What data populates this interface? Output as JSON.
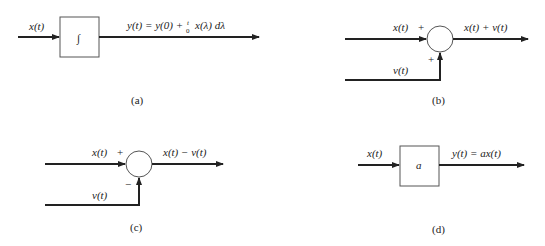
{
  "diagrams": {
    "a": {
      "caption": "(a)",
      "input_label": "x(t)",
      "block_symbol": "∫",
      "output_label": "y(t) = y(0) + ",
      "integral_upper": "t",
      "integral_lower": "0",
      "integrand": "x(λ) dλ",
      "block_type": "integrator"
    },
    "b": {
      "caption": "(b)",
      "input_top_label": "x(t)",
      "input_top_sign": "+",
      "input_bottom_label": "v(t)",
      "input_bottom_sign": "+",
      "output_label": "x(t) + v(t)",
      "block_type": "summer"
    },
    "c": {
      "caption": "(c)",
      "input_top_label": "x(t)",
      "input_top_sign": "+",
      "input_bottom_label": "v(t)",
      "input_bottom_sign": "−",
      "output_label": "x(t) − v(t)",
      "block_type": "subtractor"
    },
    "d": {
      "caption": "(d)",
      "input_label": "x(t)",
      "block_symbol": "a",
      "output_label": "y(t) = ax(t)",
      "block_type": "gain"
    }
  }
}
